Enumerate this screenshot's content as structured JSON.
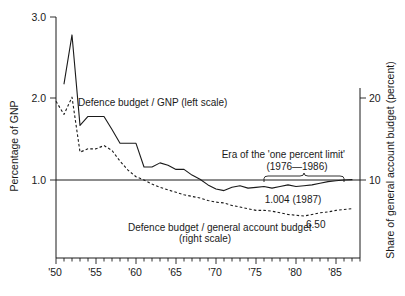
{
  "chart_data": {
    "type": "line",
    "title": "",
    "subtitle": "",
    "xlabel": "",
    "ylabel": "Percentage of GNP",
    "y2label": "Share of general account budget (percent)",
    "xlim": [
      1950,
      1988
    ],
    "ylim": [
      0.45,
      3.0
    ],
    "y2lim": [
      4.5,
      30.0
    ],
    "grid": false,
    "legend_position": "inline-annotation",
    "y_ticks": [
      "3.0",
      "2.0",
      "1.0"
    ],
    "y_tick_values": [
      3.0,
      2.0,
      1.0
    ],
    "y2_ticks": [
      "20",
      "10"
    ],
    "y2_tick_values": [
      20,
      10
    ],
    "x_ticks": [
      "'50",
      "'55",
      "'60",
      "'65",
      "'70",
      "'75",
      "'80",
      "'85"
    ],
    "x_tick_values": [
      1950,
      1955,
      1960,
      1965,
      1970,
      1975,
      1980,
      1985
    ],
    "series": [
      {
        "name": "Defence budget / GNP (left scale)",
        "style": "solid",
        "axis": "left",
        "x": [
          1951,
          1952,
          1953,
          1954,
          1955,
          1956,
          1957,
          1958,
          1959,
          1960,
          1961,
          1962,
          1963,
          1964,
          1965,
          1966,
          1967,
          1968,
          1969,
          1970,
          1971,
          1972,
          1973,
          1974,
          1975,
          1976,
          1977,
          1978,
          1979,
          1980,
          1981,
          1982,
          1983,
          1984,
          1985,
          1986,
          1987
        ],
        "values": [
          2.18,
          2.78,
          1.67,
          1.78,
          1.78,
          1.78,
          1.62,
          1.45,
          1.45,
          1.45,
          1.16,
          1.16,
          1.21,
          1.18,
          1.13,
          1.13,
          1.06,
          1.01,
          0.94,
          0.89,
          0.87,
          0.91,
          0.93,
          0.9,
          0.91,
          0.92,
          0.9,
          0.92,
          0.94,
          0.92,
          0.93,
          0.94,
          0.96,
          0.98,
          0.99,
          1.0,
          1.004
        ]
      },
      {
        "name": "Defence budget / general account budget (right scale)",
        "style": "dashed",
        "axis": "right",
        "x": [
          1950,
          1951,
          1952,
          1953,
          1954,
          1955,
          1956,
          1957,
          1958,
          1959,
          1960,
          1961,
          1962,
          1963,
          1964,
          1965,
          1966,
          1967,
          1968,
          1969,
          1970,
          1971,
          1972,
          1973,
          1974,
          1975,
          1976,
          1977,
          1978,
          1979,
          1980,
          1981,
          1982,
          1983,
          1984,
          1985,
          1986,
          1987
        ],
        "values": [
          19.6,
          18.0,
          20.1,
          13.4,
          13.8,
          13.8,
          14.2,
          13.6,
          12.3,
          11.2,
          10.4,
          10.0,
          9.5,
          9.1,
          8.8,
          8.5,
          8.2,
          8.0,
          7.8,
          7.5,
          7.3,
          7.2,
          6.9,
          6.7,
          6.5,
          6.3,
          6.3,
          6.2,
          6.0,
          5.8,
          5.7,
          5.6,
          5.8,
          6.0,
          6.1,
          6.3,
          6.4,
          6.5
        ]
      }
    ],
    "annotations": [
      {
        "name": "era-label-line1",
        "text": "Era of the 'one percent limit'",
        "x": 1984.6,
        "y_px": 158
      },
      {
        "name": "era-label-line2",
        "text": "(1976—1986)",
        "x": 1981.6,
        "y_px": 170
      },
      {
        "name": "solid-end-value",
        "text": "1.004 (1987)",
        "x": 1983.0,
        "y_px": 203
      },
      {
        "name": "dashed-end-value",
        "text": "6.50",
        "x": 1982.0,
        "y_px": 226
      },
      {
        "name": "series-solid-label",
        "text": "Defence budget / GNP (left scale)",
        "x": 1957.0,
        "y_px": 106
      },
      {
        "name": "series-dashed-label-line1",
        "text": "Defence budget / general account budget",
        "x": 1968.0,
        "y_px": 231
      },
      {
        "name": "series-dashed-label-line2",
        "text": "(right scale)",
        "x": 1967.0,
        "y_px": 242
      }
    ],
    "brace": {
      "label": "one-percent-limit-era-brace",
      "start_year": 1976,
      "end_year": 1986
    }
  }
}
